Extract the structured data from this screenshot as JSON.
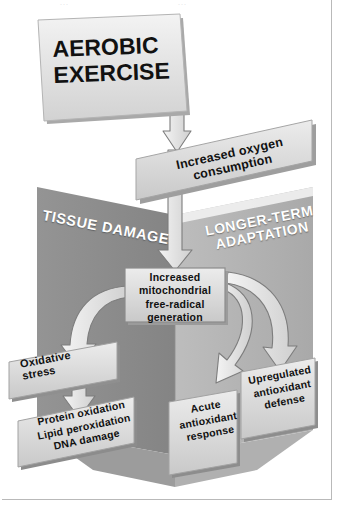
{
  "figure": {
    "title_fragment_left": "...",
    "title_fragment_right": "...",
    "type": "flow-diagram"
  },
  "nodes": {
    "source_banner": {
      "label": "AEROBIC\nEXERCISE"
    },
    "oxygen_banner": {
      "label": "Increased oxygen\nconsumption"
    },
    "left_wall": {
      "label": "TISSUE DAMAGE"
    },
    "right_wall": {
      "label": "LONGER-TERM\nADAPTATION"
    },
    "center_box": {
      "label": "Increased\nmitochondrial\nfree-radical\ngeneration"
    },
    "oxidative_stress": {
      "label": "Oxidative\nstress"
    },
    "damage_outcomes": {
      "label": "Protein oxidation\nLipid peroxidation\nDNA damage"
    },
    "acute_response": {
      "label": "Acute\nantioxidant\nresponse"
    },
    "upregulated_defense": {
      "label": "Upregulated\nantioxidant\ndefense"
    }
  },
  "arrows": [
    {
      "name": "exercise-to-oxygen",
      "from": "source_banner",
      "to": "oxygen_banner"
    },
    {
      "name": "oxygen-to-center",
      "from": "oxygen_banner",
      "to": "center_box"
    },
    {
      "name": "center-to-oxidative-stress",
      "from": "center_box",
      "to": "oxidative_stress"
    },
    {
      "name": "oxidative-stress-to-damage",
      "from": "oxidative_stress",
      "to": "damage_outcomes"
    },
    {
      "name": "center-to-acute-response",
      "from": "center_box",
      "to": "acute_response"
    },
    {
      "name": "center-to-upregulated-defense",
      "from": "center_box",
      "to": "upregulated_defense"
    }
  ],
  "colors": {
    "left_wall": "#8e8e8e",
    "right_wall": "#b4b4b4",
    "floor": "#a8a8a8",
    "card_face": "#dcdcdc",
    "card_edge": "#9a9a9a",
    "arrow_fill": "#e4e4e4",
    "arrow_stroke": "#7d7d7d",
    "text_dark": "#111111",
    "text_light": "#ffffff",
    "frame_border": "#b9b9b9",
    "background": "#ffffff"
  }
}
